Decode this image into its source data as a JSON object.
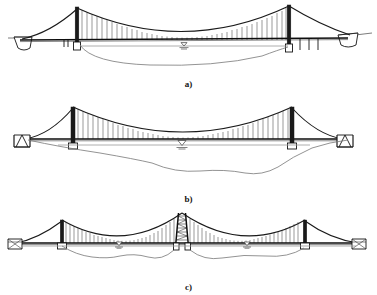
{
  "figure": {
    "background_color": "#ffffff",
    "line_color": "#141414",
    "water_color": "#9a9a9a",
    "riverbed_color": "#777777",
    "panel_count": 3
  },
  "panels": [
    {
      "id": "a",
      "caption": "a)",
      "name": "single-span-suspension-bridge-asymmetric",
      "description": "Single main span suspension bridge with two towers, gravity abutments at both banks and approach-span piers",
      "tower_count": 2,
      "main_span_count": 1,
      "anchorage_type": "gravity-abutment",
      "water_level_symbols": 1,
      "hanger_count": 44,
      "towers": [
        {
          "label": "tower-left",
          "x": 77,
          "base_y": 42,
          "top_y": 7
        },
        {
          "label": "tower-right",
          "x": 289,
          "base_y": 44,
          "top_y": 5
        }
      ],
      "deck_level": 40
    },
    {
      "id": "b",
      "caption": "b)",
      "name": "single-span-suspension-bridge-symmetric",
      "description": "Symmetric single main span suspension bridge with splayed-leg anchor blocks on both banks",
      "tower_count": 2,
      "main_span_count": 1,
      "anchorage_type": "splayed-anchor-block",
      "water_level_symbols": 1,
      "hanger_count": 52,
      "towers": [
        {
          "label": "tower-left",
          "x": 73,
          "base_y": 52,
          "top_y": 12
        },
        {
          "label": "tower-right",
          "x": 292,
          "base_y": 52,
          "top_y": 12
        }
      ],
      "deck_level": 44
    },
    {
      "id": "c",
      "caption": "c)",
      "name": "multi-span-suspension-bridge",
      "description": "Three-tower, two main span suspension bridge with braced central tower and block anchorages",
      "tower_count": 3,
      "main_span_count": 2,
      "anchorage_type": "block-anchorage",
      "water_level_symbols": 2,
      "hanger_count": 60,
      "towers": [
        {
          "label": "tower-left",
          "x": 62,
          "base_y": 38,
          "top_y": 13
        },
        {
          "label": "tower-center",
          "x": 182,
          "base_y": 38,
          "top_y": 5
        },
        {
          "label": "tower-right",
          "x": 305,
          "base_y": 38,
          "top_y": 13
        }
      ],
      "deck_level": 36
    }
  ],
  "legend": {
    "water_level_symbol_name": "water-level-marker",
    "water_level_symbol_glyph": "inverted-triangle-with-hatching"
  }
}
